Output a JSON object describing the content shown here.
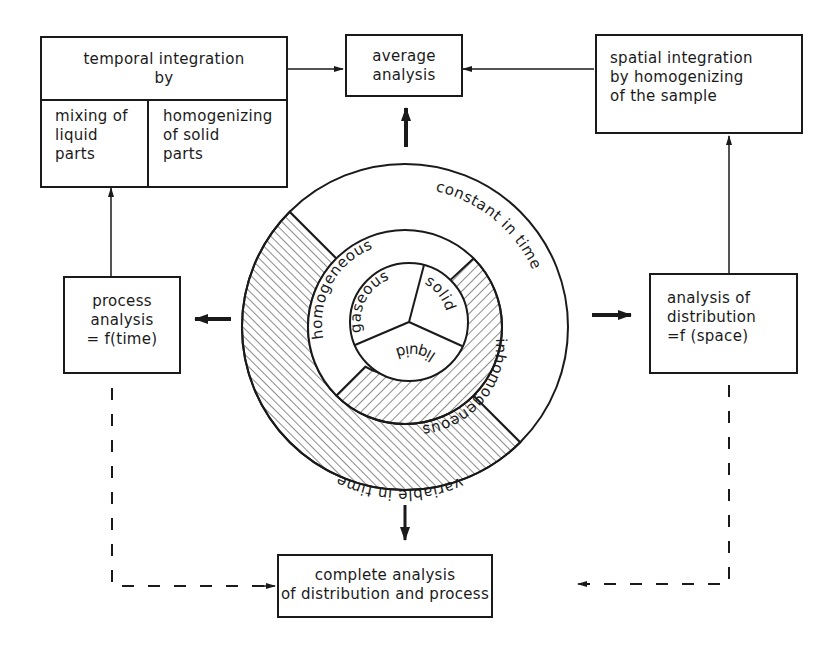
{
  "diagram": {
    "boxes": {
      "temporal_integration": {
        "title_line1": "temporal integration",
        "title_line2": "by",
        "left_cell": [
          "mixing of",
          "liquid",
          "parts"
        ],
        "right_cell": [
          "homogenizing",
          "of solid",
          "parts"
        ]
      },
      "average_analysis": {
        "lines": [
          "average",
          "analysis"
        ]
      },
      "spatial_integration": {
        "lines": [
          "spatial integration",
          "by homogenizing",
          "of the sample"
        ]
      },
      "process_analysis": {
        "lines": [
          "process",
          "analysis",
          "= f(time)"
        ]
      },
      "distribution_analysis": {
        "lines": [
          "analysis of",
          "distribution",
          "=f (space)"
        ]
      },
      "complete_analysis": {
        "lines": [
          "complete analysis",
          "of distribution and process"
        ]
      }
    },
    "circle": {
      "outer_ring": {
        "constant_label": "constant in time",
        "variable_label": "variable in time"
      },
      "middle_ring": {
        "homogeneous_label": "homogeneous",
        "inhomogeneous_label": "inhomogeneous"
      },
      "inner_circle": {
        "sectors": [
          "gaseous",
          "solid",
          "liquid"
        ]
      }
    },
    "colors": {
      "ink": "#1a1a1a",
      "background": "#ffffff"
    }
  }
}
